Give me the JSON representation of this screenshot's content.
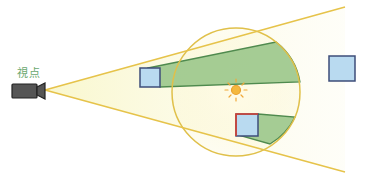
{
  "diagram": {
    "viewpoint_label": "視点",
    "colors": {
      "frustum_line": "#e6c34a",
      "frustum_fill": "#f7f3b8",
      "light_circle": "#e0c04a",
      "shadow_fill": "#8fc07f",
      "shadow_stroke": "#4f8a4e",
      "box_fill": "#b9daf0",
      "box_stroke": "#3e4d7a",
      "highlight_edge": "#d9402f",
      "sun": "#f0b03a",
      "camera": "#555555"
    },
    "elements": {
      "camera": "viewpoint camera",
      "light": "point light (sun icon)",
      "boxes": [
        "occluder box inside frustum",
        "box receiving shadow",
        "box outside light range"
      ]
    }
  }
}
